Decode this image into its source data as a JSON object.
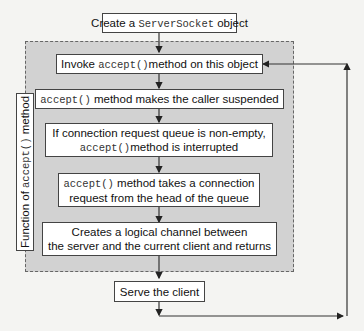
{
  "diagram": {
    "start": {
      "pre": "Create a ",
      "code": "ServerSocket",
      "post": " object"
    },
    "group_label": {
      "pre": "Function of ",
      "code": "accept()",
      "post": " method"
    },
    "steps": [
      {
        "pre": "Invoke ",
        "code": "accept()",
        "post": "method on this object"
      },
      {
        "code": "accept()",
        "post": " method makes the caller suspended"
      },
      {
        "line1": "If connection  request queue is non-empty,",
        "code": "accept()",
        "post": "method is interrupted"
      },
      {
        "code": "accept()",
        "post": " method takes a connection",
        "line2": "request from the head of the queue"
      },
      {
        "line1": "Creates a logical channel between",
        "line2": "the server and the current client and returns"
      }
    ],
    "end": {
      "label": "Serve the client"
    },
    "loop": "Serve the client loops back to Invoke accept() method on this object"
  }
}
